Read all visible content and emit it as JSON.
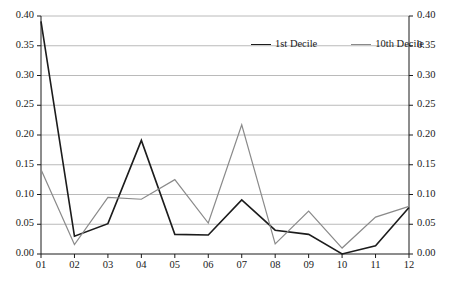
{
  "chart_data": {
    "type": "line",
    "title": "",
    "xlabel": "",
    "ylabel": "",
    "categories": [
      "01",
      "02",
      "03",
      "04",
      "05",
      "06",
      "07",
      "08",
      "09",
      "10",
      "11",
      "12"
    ],
    "ylim": [
      0.0,
      0.4
    ],
    "ytick_step": 0.05,
    "ytick_labels": [
      "0.00",
      "0.05",
      "0.10",
      "0.15",
      "0.20",
      "0.25",
      "0.30",
      "0.35",
      "0.40"
    ],
    "ytick_values": [
      0.0,
      0.05,
      0.1,
      0.15,
      0.2,
      0.25,
      0.3,
      0.35,
      0.4
    ],
    "dual_axis": true,
    "grid": "horizontal",
    "legend_position": "top-center",
    "series": [
      {
        "name": "1st Decile",
        "color": "#1c1c1c",
        "width": 1.6,
        "values": [
          0.391,
          0.03,
          0.051,
          0.191,
          0.033,
          0.032,
          0.091,
          0.04,
          0.033,
          0.0,
          0.014,
          0.078
        ]
      },
      {
        "name": "10th Decile",
        "color": "#8a8a8a",
        "width": 1.2,
        "values": [
          0.142,
          0.016,
          0.095,
          0.092,
          0.125,
          0.052,
          0.217,
          0.017,
          0.072,
          0.01,
          0.062,
          0.08
        ]
      }
    ]
  },
  "axes": {
    "left_labels": [
      "0.40",
      "0.35",
      "0.30",
      "0.25",
      "0.20",
      "0.15",
      "0.10",
      "0.05",
      "0.00"
    ],
    "right_labels": [
      "0.40",
      "0.35",
      "0.30",
      "0.25",
      "0.20",
      "0.15",
      "0.10",
      "0.05",
      "0.00"
    ],
    "x_labels": [
      "01",
      "02",
      "03",
      "04",
      "05",
      "06",
      "07",
      "08",
      "09",
      "10",
      "11",
      "12"
    ]
  },
  "legend": {
    "entries": [
      {
        "label": "1st Decile",
        "color": "#1c1c1c"
      },
      {
        "label": "10th Decile",
        "color": "#8a8a8a"
      }
    ]
  },
  "colors": {
    "series_1": "#1c1c1c",
    "series_2": "#8a8a8a",
    "grid": "#a8a8a8",
    "axis": "#1a1a1a",
    "background": "#ffffff"
  }
}
